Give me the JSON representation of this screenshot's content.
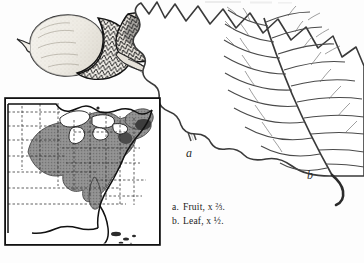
{
  "plate": {
    "kind": "botanical-illustration-plate",
    "background_color": "#fdfdfd",
    "ink_color": "#1a1a1a"
  },
  "figures": {
    "fruit": {
      "label": "a",
      "subject": "acorns-with-long-peduncle",
      "description": "two acorns, scaly cross-hatched cups, pale nut, long curving stalk",
      "cup_shading_color": "#2b2b2b",
      "nut_tone_color": "#d9d6cf"
    },
    "leaf": {
      "label": "b",
      "subject": "oak-leaf",
      "description": "wavy shallow-lobed oak leaf with pinnate venation, cropped at right edge",
      "outline_color": "#3a3a3a"
    }
  },
  "map": {
    "title": "",
    "subject": "united-states-range-map",
    "frame_color": "#111111",
    "land_color": "#ffffff",
    "range_shading_color": "#8a8a8a",
    "boundary_color": "#2b2b2b",
    "state_line_style": "dashed",
    "range_description": "shaded distribution across the midwest, ohio valley and northeast"
  },
  "caption": {
    "lines": [
      {
        "key": "a.",
        "text": "Fruit, x ⅔."
      },
      {
        "key": "b.",
        "text": "Leaf, x ½."
      }
    ]
  }
}
